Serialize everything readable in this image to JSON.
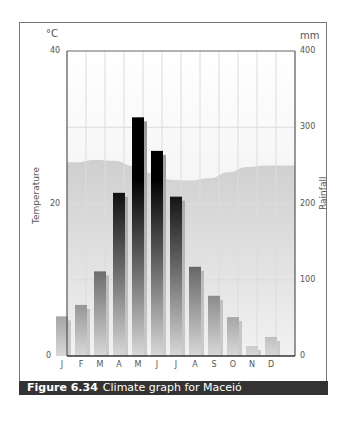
{
  "chart_data": {
    "type": "bar",
    "title": "Climate graph for Maceió",
    "figure_label": "Figure 6.34",
    "categories": [
      "J",
      "F",
      "M",
      "A",
      "M",
      "J",
      "J",
      "A",
      "S",
      "O",
      "N",
      "D"
    ],
    "series": [
      {
        "name": "Rainfall",
        "unit": "mm",
        "axis": "right",
        "type": "bar",
        "values": [
          52,
          67,
          111,
          214,
          313,
          269,
          209,
          117,
          79,
          51,
          13,
          25
        ]
      },
      {
        "name": "Temperature",
        "unit": "°C",
        "axis": "left",
        "type": "area",
        "values": [
          25.4,
          25.7,
          25.6,
          24.9,
          23.9,
          23.1,
          23.0,
          23.3,
          24.1,
          24.8,
          25.0,
          25.0
        ]
      }
    ],
    "left_axis": {
      "label": "Temperature",
      "unit": "°C",
      "ylim": [
        0,
        40
      ],
      "ticks": [
        0,
        20,
        40
      ]
    },
    "right_axis": {
      "label": "Rainfall",
      "unit": "mm",
      "ylim": [
        0,
        400
      ],
      "ticks": [
        0,
        100,
        200,
        300,
        400
      ]
    },
    "grid": true,
    "legend": "none"
  },
  "caption": {
    "figure": "Figure 6.34",
    "text": "Climate graph for Maceió"
  },
  "axes": {
    "left_unit": "°C",
    "right_unit": "mm",
    "left_title": "Temperature",
    "right_title": "Rainfall",
    "left_ticks": [
      "40",
      "20",
      "0"
    ],
    "right_ticks": [
      "400",
      "300",
      "200",
      "100",
      "0"
    ]
  },
  "colors": {
    "caption_bg": "#333333",
    "temp_area": "#d4d4d4",
    "grid": "#dddddd",
    "frame": "#777777"
  }
}
